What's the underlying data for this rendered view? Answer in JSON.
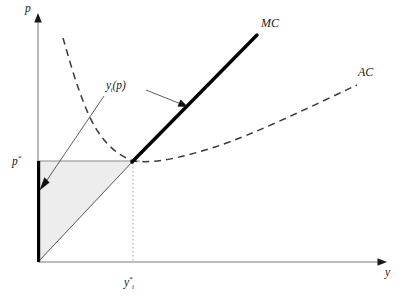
{
  "figure": {
    "name": "competitive-firm-supply-diagram",
    "background_color": "#ffffff",
    "width": 403,
    "height": 305
  },
  "axes": {
    "vertical": {
      "label": "p",
      "meaning": "price",
      "x_pixel": 38,
      "top_pixel": 18,
      "bottom_pixel": 262,
      "color": "#7d7d7d"
    },
    "horizontal": {
      "label": "y",
      "meaning": "output quantity",
      "y_pixel": 262,
      "left_pixel": 38,
      "right_pixel": 385,
      "color": "#7d7d7d"
    },
    "origin": {
      "x": 38,
      "y": 262
    }
  },
  "marked_values": {
    "price_star": {
      "label_html": "p<sup>*</sup>",
      "label_text": "p*",
      "y_pixel": 161,
      "description": "equilibrium price equal to minimum average cost"
    },
    "quantity_star": {
      "label_html": "y<sup>*</sup><sub>i</sub>",
      "label_text": "y*_i",
      "x_pixel": 133,
      "description": "profit maximising output of firm i at price p*"
    }
  },
  "curves": {
    "marginal_cost": {
      "label": "MC",
      "name": "marginal-cost-curve",
      "style": "solid-thick",
      "color": "#000000",
      "points": [
        [
          133,
          161
        ],
        [
          257,
          35
        ]
      ],
      "axis_segment": [
        [
          38,
          161
        ],
        [
          38,
          262
        ]
      ]
    },
    "average_cost": {
      "label": "AC",
      "name": "average-cost-curve",
      "style": "dashed",
      "color": "#3a3a3a",
      "points": [
        [
          63,
          38
        ],
        [
          72,
          70
        ],
        [
          82,
          100
        ],
        [
          94,
          126
        ],
        [
          108,
          146
        ],
        [
          120,
          156
        ],
        [
          133,
          161
        ],
        [
          150,
          163
        ],
        [
          175,
          159
        ],
        [
          205,
          151
        ],
        [
          240,
          140
        ],
        [
          280,
          122
        ],
        [
          320,
          103
        ],
        [
          357,
          85
        ]
      ],
      "minimum_point": [
        133,
        161
      ]
    },
    "supply_ray": {
      "label_html": "y<sub>i</sub>(p)",
      "label_text": "y_i(p)",
      "name": "firm-supply-function",
      "style": "thin-solid",
      "color": "#555555",
      "points": [
        [
          38,
          262
        ],
        [
          133,
          161
        ]
      ],
      "label_tail": [
        [
          103,
          92
        ],
        [
          38,
          185
        ]
      ]
    }
  },
  "annotations": {
    "mc_pointer": {
      "name": "mc-pointer-arrow",
      "from": [
        144,
        90
      ],
      "to": [
        186,
        106
      ]
    },
    "supply_pointer": {
      "name": "supply-pointer-arrow",
      "from": [
        103,
        95
      ],
      "to": [
        41,
        186
      ]
    },
    "shaded_region": {
      "name": "producer-surplus-region",
      "fill_color": "#ededed",
      "vertices": [
        [
          38,
          262
        ],
        [
          38,
          161
        ],
        [
          133,
          161
        ]
      ],
      "description": "shaded area between the price line, the vertical axis and the supply ray"
    }
  },
  "labels": {
    "p_axis": "p",
    "y_axis": "y",
    "mc": "MC",
    "ac": "AC"
  }
}
